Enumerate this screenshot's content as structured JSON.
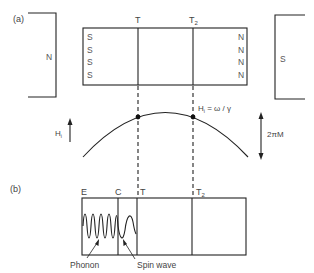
{
  "panel_a": {
    "label": "(a)",
    "left_magnet_pole": "N",
    "right_magnet_pole": "S",
    "sample_left_poles": [
      "S",
      "S",
      "S",
      "S"
    ],
    "sample_right_poles": [
      "N",
      "N",
      "N",
      "N"
    ],
    "marker_t": "T",
    "marker_t2_base": "T",
    "marker_t2_sub": "2",
    "field_axis_label": "H",
    "field_axis_sub": "i",
    "resonance_label": "H",
    "resonance_sub": "i",
    "resonance_eq": " = ω / γ",
    "range_label": "2πM"
  },
  "panel_b": {
    "label": "(b)",
    "marker_e": "E",
    "marker_c": "C",
    "marker_t": "T",
    "marker_t2_base": "T",
    "marker_t2_sub": "2",
    "phonon_label": "Phonon",
    "spin_wave_label": "Spin wave"
  },
  "colors": {
    "line": "#222222",
    "text": "#444444",
    "background": "#ffffff"
  }
}
